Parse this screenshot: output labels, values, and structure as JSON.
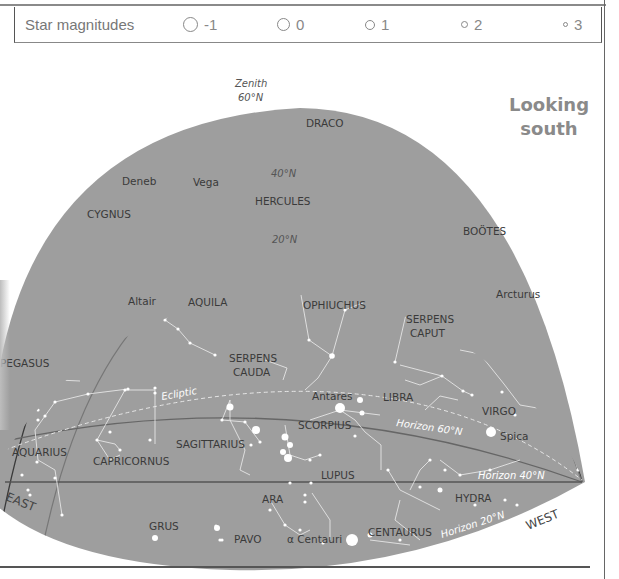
{
  "legend": {
    "title": "Star magnitudes",
    "magnitudes": [
      {
        "label": "-1",
        "size": 15
      },
      {
        "label": "0",
        "size": 13
      },
      {
        "label": "1",
        "size": 10
      },
      {
        "label": "2",
        "size": 7
      },
      {
        "label": "3",
        "size": 5
      }
    ]
  },
  "chart": {
    "title_line1": "Looking",
    "title_line2": "south",
    "zenith_label": "Zenith",
    "zenith_lat": "60°N",
    "lat_40": "40°N",
    "lat_20": "20°N",
    "ecliptic": "Ecliptic",
    "horizon_60": "Horizon 60°N",
    "horizon_40": "Horizon 40°N",
    "horizon_20": "Horizon 20°N",
    "east": "EAST",
    "west": "WEST",
    "sky_color": "#9e9e9e",
    "constellations": [
      "DRACO",
      "HERCULES",
      "CYGNUS",
      "BOÖTES",
      "AQUILA",
      "OPHIUCHUS",
      "SERPENS CAPUT",
      "PEGASUS",
      "SERPENS CAUDA",
      "LIBRA",
      "SCORPIUS",
      "VIRGO",
      "AQUARIUS",
      "CAPRICORNUS",
      "SAGITTARIUS",
      "LUPUS",
      "HYDRA",
      "ARA",
      "GRUS",
      "PAVO",
      "CENTAURUS"
    ],
    "stars": [
      "Deneb",
      "Vega",
      "Arcturus",
      "Altair",
      "Antares",
      "Spica",
      "α Centauri"
    ]
  }
}
